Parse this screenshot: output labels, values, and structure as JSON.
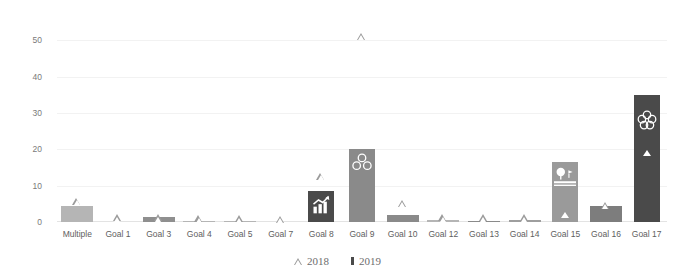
{
  "chart_data": {
    "type": "bar",
    "title": "",
    "subtitle": "",
    "xlabel": "",
    "ylabel": "",
    "ylim": [
      0,
      55
    ],
    "yticks": [
      0,
      10,
      20,
      30,
      40,
      50
    ],
    "ytick_labels": [
      "0",
      "10",
      "20",
      "30",
      "40",
      "50"
    ],
    "grid": true,
    "legend_position": "bottom-center",
    "categories": [
      "Multiple",
      "Goal 1",
      "Goal 3",
      "Goal 4",
      "Goal 5",
      "Goal 7",
      "Goal 8",
      "Goal 9",
      "Goal 10",
      "Goal 12",
      "Goal 13",
      "Goal 14",
      "Goal 15",
      "Goal 16",
      "Goal 17"
    ],
    "series": [
      {
        "name": "2018",
        "marker": "open-triangle",
        "color": "#9b9b9b",
        "values": [
          5.5,
          1,
          1,
          0.7,
          0.7,
          0.5,
          12.5,
          51,
          5,
          1,
          1,
          1,
          2,
          4.5,
          19
        ]
      },
      {
        "name": "2019",
        "marker": "bar",
        "color": "#8a8a8a",
        "values": [
          4.4,
          0,
          1.5,
          0.4,
          0.4,
          0,
          8.5,
          20,
          2,
          0.6,
          0.4,
          0.5,
          16.5,
          4.5,
          35
        ]
      }
    ],
    "bar_colors": [
      "#b5b5b5",
      "#b5b5b5",
      "#8f8f8f",
      "#b5b5b5",
      "#b5b5b5",
      "#b5b5b5",
      "#4a4a4a",
      "#8a8a8a",
      "#8a8a8a",
      "#b5b5b5",
      "#8a8a8a",
      "#9e9e9e",
      "#9a9a9a",
      "#7d7d7d",
      "#4a4a4a"
    ],
    "bar_icons": [
      "",
      "",
      "",
      "",
      "",
      "",
      "growth-chart-icon",
      "factory-icon",
      "",
      "",
      "",
      "",
      "tree-land-icon",
      "",
      "partnership-rings-icon"
    ],
    "legend": [
      {
        "label": "2018",
        "marker": "open-triangle"
      },
      {
        "label": "2019",
        "marker": "filled-square"
      }
    ]
  }
}
